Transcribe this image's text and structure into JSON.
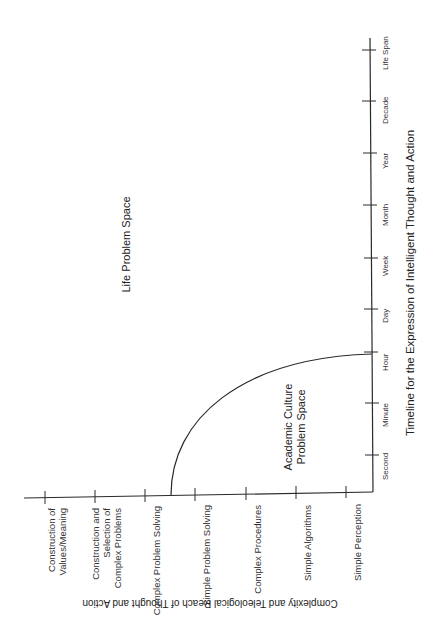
{
  "diagram": {
    "regions": {
      "life": "Life Problem Space",
      "academic_line1": "Academic Culture",
      "academic_line2": "Problem Space"
    },
    "timeline_axis": {
      "title": "Timeline for the Expression of Intelligent Thought and Action",
      "ticks": [
        "Second",
        "Minute",
        "Hour",
        "Day",
        "Week",
        "Month",
        "Year",
        "Decade",
        "Life Span"
      ]
    },
    "complexity_axis": {
      "title": "Complexity and Teleological Reach of Thought and Action",
      "ticks": [
        {
          "line1": "Construction of",
          "line2": "Values/Meaning",
          "line3": ""
        },
        {
          "line1": "Construction and",
          "line2": "Selection of",
          "line3": "Complex Problems"
        },
        {
          "line1": "Complex Problem Solving",
          "line2": "",
          "line3": ""
        },
        {
          "line1": "Simple Problem Solving",
          "line2": "",
          "line3": ""
        },
        {
          "line1": "Complex Procedures",
          "line2": "",
          "line3": ""
        },
        {
          "line1": "Simple Algorithms",
          "line2": "",
          "line3": ""
        },
        {
          "line1": "Simple Perception",
          "line2": "",
          "line3": ""
        }
      ]
    },
    "colors": {
      "line": "#2a2a2a",
      "text": "#333333",
      "background": "#ffffff"
    }
  }
}
